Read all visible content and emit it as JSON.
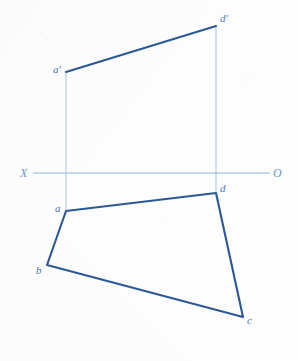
{
  "sheet": {
    "width": 298,
    "height": 361,
    "background_color": "#fdfdfd",
    "title": "Orthographic projection of quadrilateral ABCD"
  },
  "colors": {
    "outline_stroke": "#2a5899",
    "thin_stroke": "#a8c4de",
    "axis_stroke": "#8fb4d9",
    "vertex_label": "#4a74ad",
    "axis_label": "#6f97c6"
  },
  "strokes": {
    "outline_width": 2.1,
    "thin_width": 1.0,
    "axis_width": 1.1
  },
  "axis": {
    "name": "ground-line-XO",
    "y": 173,
    "x_start": 33,
    "x_end": 270,
    "left_label": "X",
    "right_label": "O",
    "left_label_x": 20,
    "left_label_y": 167,
    "right_label_x": 273,
    "right_label_y": 167
  },
  "front_view": {
    "name": "front-view-polygon",
    "points": "66,72 216,26",
    "vertices": [
      {
        "id": "a-prime",
        "label": "a′",
        "x": 66,
        "y": 72,
        "label_x": 53,
        "label_y": 64
      },
      {
        "id": "d-prime",
        "label": "d′",
        "x": 216,
        "y": 26,
        "label_x": 220,
        "label_y": 13
      }
    ],
    "edges": [
      {
        "from": "a-prime",
        "to": "d-prime",
        "x1": 66,
        "y1": 72,
        "x2": 216,
        "y2": 26,
        "weight": "thick"
      }
    ]
  },
  "top_view": {
    "name": "top-view-polygon",
    "points": "66,211 216,193 243,317 47,265",
    "vertices": [
      {
        "id": "a",
        "label": "a",
        "x": 66,
        "y": 211,
        "label_x": 55,
        "label_y": 203
      },
      {
        "id": "d",
        "label": "d",
        "x": 216,
        "y": 193,
        "label_x": 220,
        "label_y": 183
      },
      {
        "id": "c",
        "label": "c",
        "x": 243,
        "y": 317,
        "label_x": 247,
        "label_y": 315
      },
      {
        "id": "b",
        "label": "b",
        "x": 47,
        "y": 265,
        "label_x": 36,
        "label_y": 265
      }
    ],
    "edges": [
      {
        "from": "a",
        "to": "d",
        "x1": 66,
        "y1": 211,
        "x2": 216,
        "y2": 193,
        "weight": "thick"
      },
      {
        "from": "d",
        "to": "c",
        "x1": 216,
        "y1": 193,
        "x2": 243,
        "y2": 317,
        "weight": "thick"
      },
      {
        "from": "c",
        "to": "b",
        "x1": 243,
        "y1": 317,
        "x2": 47,
        "y2": 265,
        "weight": "thick"
      },
      {
        "from": "b",
        "to": "a",
        "x1": 47,
        "y1": 265,
        "x2": 66,
        "y2": 211,
        "weight": "thick"
      }
    ]
  },
  "projection_lines": [
    {
      "name": "projector-a",
      "x1": 66,
      "y1": 72,
      "x2": 66,
      "y2": 211,
      "weight": "thin"
    },
    {
      "name": "projector-d",
      "x1": 216,
      "y1": 26,
      "x2": 216,
      "y2": 193,
      "weight": "thin"
    }
  ],
  "labels_order": [
    "d′",
    "a′",
    "X",
    "O",
    "d",
    "a",
    "b",
    "c"
  ]
}
